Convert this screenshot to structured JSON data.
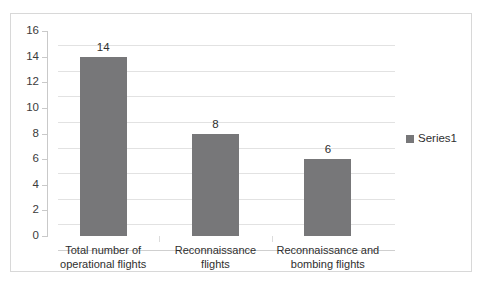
{
  "chart_data": {
    "type": "bar",
    "title": "",
    "xlabel": "",
    "ylabel": "",
    "categories": [
      "Total number of operational flights",
      "Reconnaissance flights",
      "Reconnaissance and bombing flights"
    ],
    "category_lines": [
      [
        "Total number of",
        "operational flights"
      ],
      [
        "Reconnaissance",
        "flights"
      ],
      [
        "Reconnaissance and",
        "bombing flights"
      ]
    ],
    "values": [
      14,
      8,
      6
    ],
    "value_labels": [
      "14",
      "8",
      "6"
    ],
    "series": [
      {
        "name": "Series1",
        "values": [
          14,
          8,
          6
        ]
      }
    ],
    "ylim": [
      0,
      16
    ],
    "ytick_step": 2,
    "ytick_labels": [
      "16",
      "14",
      "12",
      "10",
      "8",
      "6",
      "4",
      "2",
      "0"
    ],
    "ytick_values": [
      16,
      14,
      12,
      10,
      8,
      6,
      4,
      2,
      0
    ],
    "grid": true,
    "legend": {
      "position": "right",
      "entries": [
        "Series1"
      ]
    },
    "colors": {
      "bar": "#777779",
      "gridline": "#e2e2e2",
      "axis": "#c9c9c9",
      "frame": "#d8d8d8",
      "background": "#ffffff",
      "text": "#2f2f2f"
    }
  },
  "legend": {
    "swatch_icon": "legend-square-icon",
    "series_label": "Series1"
  }
}
